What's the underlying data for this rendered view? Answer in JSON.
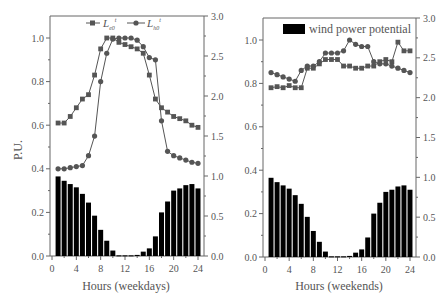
{
  "chart_data": [
    {
      "type": "bar+line",
      "panel": "weekdays",
      "xlabel": "Hours (weekdays)",
      "ylabel": "P.U.",
      "xticks": [
        0,
        4,
        8,
        12,
        16,
        20,
        24
      ],
      "yticks_left": [
        0.0,
        0.2,
        0.4,
        0.6,
        0.8,
        1.0
      ],
      "yticks_left_labels": [
        "0.0",
        "0.2",
        "0.4",
        "0.6",
        "0.8",
        "1.0"
      ],
      "yticks_right": [
        0.0,
        0.5,
        1.0,
        1.5,
        2.0,
        2.5,
        3.0
      ],
      "yticks_right_labels": [
        "0.0",
        "0.5",
        "1.0",
        "1.5",
        "2.0",
        "2.5",
        "3.0"
      ],
      "xlim": [
        0,
        24.5
      ],
      "ylim_left": [
        0,
        1.1
      ],
      "ylim_right": [
        0,
        3.0
      ],
      "x": [
        1,
        2,
        3,
        4,
        5,
        6,
        7,
        8,
        9,
        10,
        11,
        12,
        13,
        14,
        15,
        16,
        17,
        18,
        19,
        20,
        21,
        22,
        23,
        24
      ],
      "legend": [
        "L_e0^t",
        "L_h0^t"
      ],
      "series": [
        {
          "name": "L_e0^t",
          "marker": "square",
          "values": [
            0.61,
            0.61,
            0.64,
            0.68,
            0.72,
            0.74,
            0.83,
            0.95,
            1.0,
            1.0,
            0.98,
            0.97,
            0.96,
            0.95,
            0.93,
            0.83,
            0.72,
            0.68,
            0.66,
            0.64,
            0.63,
            0.62,
            0.6,
            0.59
          ]
        },
        {
          "name": "L_h0^t",
          "marker": "circle",
          "values": [
            0.4,
            0.4,
            0.405,
            0.41,
            0.415,
            0.46,
            0.55,
            0.8,
            0.93,
            0.995,
            1.0,
            1.0,
            1.0,
            0.99,
            0.96,
            0.91,
            0.9,
            0.62,
            0.48,
            0.46,
            0.45,
            0.44,
            0.43,
            0.425
          ]
        },
        {
          "name": "wind power potential",
          "type": "bar",
          "values": [
            0.365,
            0.345,
            0.33,
            0.315,
            0.285,
            0.245,
            0.185,
            0.12,
            0.07,
            0.025,
            0.003,
            0.003,
            0.003,
            0.005,
            0.02,
            0.035,
            0.09,
            0.2,
            0.25,
            0.3,
            0.31,
            0.325,
            0.33,
            0.31
          ]
        }
      ]
    },
    {
      "type": "bar+line",
      "panel": "weekends",
      "xlabel": "Hours (weekends)",
      "ylabel": "",
      "xticks": [
        0,
        4,
        8,
        12,
        16,
        20,
        24
      ],
      "yticks_left": [
        0.0,
        0.2,
        0.4,
        0.6,
        0.8,
        1.0
      ],
      "yticks_left_labels": [
        "0.0",
        "0.2",
        "0.4",
        "0.6",
        "0.8",
        "1.0"
      ],
      "yticks_right": [
        0.0,
        0.5,
        1.0,
        1.5,
        2.0,
        2.5,
        3.0
      ],
      "yticks_right_labels": [
        "0.0",
        "0.5",
        "1.0",
        "1.5",
        "2.0",
        "2.5",
        "3.0"
      ],
      "xlim": [
        0,
        24.5
      ],
      "ylim_left": [
        0,
        1.1
      ],
      "ylim_right": [
        0,
        3.0
      ],
      "x": [
        1,
        2,
        3,
        4,
        5,
        6,
        7,
        8,
        9,
        10,
        11,
        12,
        13,
        14,
        15,
        16,
        17,
        18,
        19,
        20,
        21,
        22,
        23,
        24
      ],
      "legend": [
        "wind power potential"
      ],
      "series": [
        {
          "name": "L_e0^t",
          "marker": "square",
          "values": [
            0.78,
            0.785,
            0.78,
            0.79,
            0.78,
            0.78,
            0.87,
            0.87,
            0.89,
            0.91,
            0.91,
            0.91,
            0.88,
            0.88,
            0.87,
            0.87,
            0.88,
            0.88,
            0.9,
            0.91,
            0.9,
            0.99,
            0.95,
            0.95
          ]
        },
        {
          "name": "L_h0^t",
          "marker": "circle",
          "values": [
            0.85,
            0.84,
            0.83,
            0.82,
            0.81,
            0.86,
            0.88,
            0.88,
            0.9,
            0.94,
            0.94,
            0.94,
            0.95,
            1.0,
            0.98,
            0.97,
            0.97,
            0.9,
            0.89,
            0.89,
            0.88,
            0.87,
            0.86,
            0.85
          ]
        },
        {
          "name": "wind power potential",
          "type": "bar",
          "values": [
            0.365,
            0.345,
            0.33,
            0.315,
            0.285,
            0.245,
            0.185,
            0.12,
            0.07,
            0.025,
            0.003,
            0.003,
            0.003,
            0.005,
            0.02,
            0.035,
            0.09,
            0.2,
            0.25,
            0.3,
            0.31,
            0.325,
            0.33,
            0.31
          ]
        }
      ]
    }
  ],
  "labels": {
    "left_xlabel": "Hours (weekdays)",
    "right_xlabel": "Hours (weekends)",
    "ylabel": "P.U.",
    "legend_left_1_main": "L",
    "legend_left_1_sub": "e0",
    "legend_left_1_sup": "t",
    "legend_left_2_main": "L",
    "legend_left_2_sub": "h0",
    "legend_left_2_sup": "t",
    "legend_right": "wind power potential"
  }
}
